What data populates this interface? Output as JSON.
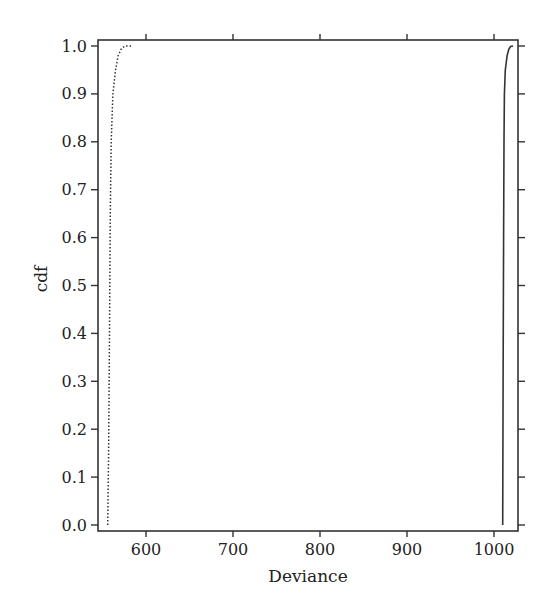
{
  "chart_data": {
    "type": "line",
    "title": "",
    "xlabel": "Deviance",
    "ylabel": "cdf",
    "xlim": [
      545,
      1028
    ],
    "ylim": [
      0.0,
      1.0
    ],
    "xticks": [
      600,
      700,
      800,
      900,
      1000
    ],
    "yticks": [
      0.0,
      0.1,
      0.2,
      0.3,
      0.4,
      0.5,
      0.6,
      0.7,
      0.8,
      0.9,
      1.0
    ],
    "ytick_labels": [
      "0.0",
      "0.1",
      "0.2",
      "0.3",
      "0.4",
      "0.5",
      "0.6",
      "0.7",
      "0.8",
      "0.9",
      "1.0"
    ],
    "xtick_labels": [
      "600",
      "700",
      "800",
      "900",
      "1000"
    ],
    "grid": false,
    "legend": null,
    "series": [
      {
        "name": "dotted",
        "style": "dotted",
        "x": [
          556,
          557,
          558,
          559,
          560,
          562,
          565,
          568,
          572,
          576,
          583
        ],
        "y": [
          0.0,
          0.15,
          0.4,
          0.65,
          0.8,
          0.9,
          0.95,
          0.98,
          0.995,
          1.0,
          1.0
        ]
      },
      {
        "name": "solid",
        "style": "solid",
        "x": [
          1010,
          1010.5,
          1011,
          1011.5,
          1012,
          1013,
          1015,
          1017,
          1019,
          1022
        ],
        "y": [
          0.0,
          0.3,
          0.6,
          0.8,
          0.9,
          0.95,
          0.98,
          0.993,
          0.999,
          1.0
        ]
      }
    ]
  }
}
